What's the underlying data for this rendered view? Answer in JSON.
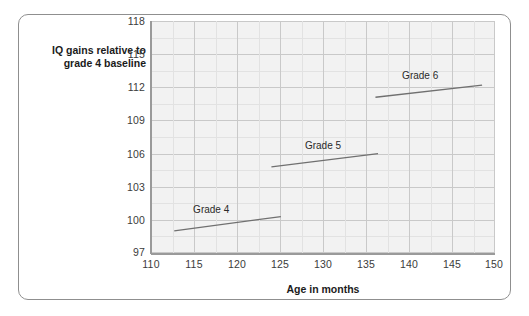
{
  "chart_data": {
    "type": "line",
    "title": "",
    "xlabel": "Age in months",
    "ylabel": "IQ gains relative to grade 4 baseline",
    "ylabel_line1": "IQ gains relative to",
    "ylabel_line2": "grade 4 baseline",
    "xlim": [
      110,
      150
    ],
    "ylim": [
      97,
      118
    ],
    "x_ticks": [
      110,
      115,
      120,
      125,
      130,
      135,
      140,
      145,
      150
    ],
    "y_ticks": [
      97,
      100,
      103,
      106,
      109,
      112,
      115,
      118
    ],
    "x_tick_labels": [
      "110",
      "115",
      "120",
      "125",
      "130",
      "135",
      "140",
      "145",
      "150"
    ],
    "y_tick_labels": [
      "97",
      "100",
      "103",
      "106",
      "109",
      "112",
      "115",
      "118"
    ],
    "grid": true,
    "minor_grid": true,
    "legend": "inline-annotations",
    "series": [
      {
        "name": "Grade 4",
        "label": "Grade 4",
        "label_x": 117.0,
        "label_y": 100.9,
        "x": [
          112.7,
          125.1
        ],
        "y": [
          99.0,
          100.3
        ],
        "points": [
          [
            112.7,
            99.0
          ],
          [
            125.1,
            100.3
          ]
        ]
      },
      {
        "name": "Grade 5",
        "label": "Grade 5",
        "label_x": 130.0,
        "label_y": 106.7,
        "x": [
          124.0,
          136.4
        ],
        "y": [
          104.8,
          106.0
        ],
        "points": [
          [
            124.0,
            104.8
          ],
          [
            136.4,
            106.0
          ]
        ]
      },
      {
        "name": "Grade 6",
        "label": "Grade 6",
        "label_x": 141.3,
        "label_y": 113.0,
        "x": [
          136.1,
          148.5
        ],
        "y": [
          111.1,
          112.2
        ],
        "points": [
          [
            136.1,
            111.1
          ],
          [
            148.5,
            112.2
          ]
        ]
      }
    ],
    "colors": {
      "line": "#707070",
      "plot_background": "#f2f2f2",
      "major_gridline": "#c9c9c9",
      "minor_gridline": "#e2e2e2",
      "axis": "#9a9a9a",
      "text": "#1b1b1b",
      "frame_border": "#8f8f8f"
    }
  }
}
